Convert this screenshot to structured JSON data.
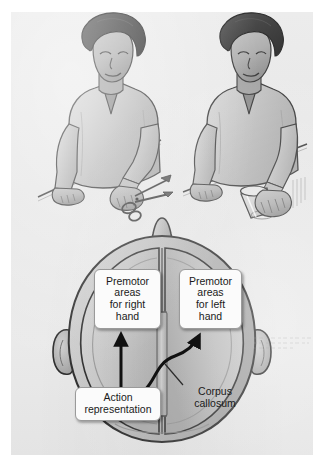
{
  "figure": {
    "domain": "diagram",
    "page_background": "#e9e9e9"
  },
  "photos": {
    "left": {
      "name": "person-cutting-with-scissors",
      "object": "scissors",
      "acting_hand": "right"
    },
    "right": {
      "name": "person-grasping-glass",
      "object": "drinking glass",
      "acting_hand": "right"
    }
  },
  "brain_diagram": {
    "view": "superior (top-down) view of head and brain",
    "midline_structure": "corpus callosum",
    "callouts": {
      "premotor_right": {
        "line1": "Premotor",
        "line2": "areas",
        "line3": "for right",
        "line4": "hand",
        "full_text": "Premotor areas for right hand"
      },
      "premotor_left": {
        "line1": "Premotor",
        "line2": "areas",
        "line3": "for left",
        "line4": "hand",
        "full_text": "Premotor areas for left hand"
      },
      "action_representation": {
        "line1": "Action",
        "line2": "representation",
        "full_text": "Action representation"
      },
      "corpus_callosum": {
        "line1": "Corpus",
        "line2": "callosum",
        "full_text": "Corpus callosum"
      }
    },
    "arrows": [
      {
        "name": "arrow-straight-to-right-hand-area",
        "from": "Action representation",
        "to": "Premotor areas for right hand",
        "style": "straight vertical"
      },
      {
        "name": "arrow-curved-across-callosum",
        "from": "Action representation",
        "to": "Premotor areas for left hand",
        "style": "curved, crossing the midline"
      }
    ],
    "leader_lines": [
      {
        "name": "leader-corpus-callosum",
        "label": "Corpus callosum",
        "points_to": "midline band between hemispheres"
      }
    ]
  },
  "colors": {
    "page": "#e9e9e9",
    "hair": "#4a4a4a",
    "skin": "#b4b4b4",
    "shirt": "#c8c8c8",
    "brain_fill": "#c0c0c0",
    "outline": "#2b2b2b",
    "callout_fill": "#fbfbfb",
    "callout_border": "#9a9a9a",
    "text": "#1a1a1a"
  }
}
